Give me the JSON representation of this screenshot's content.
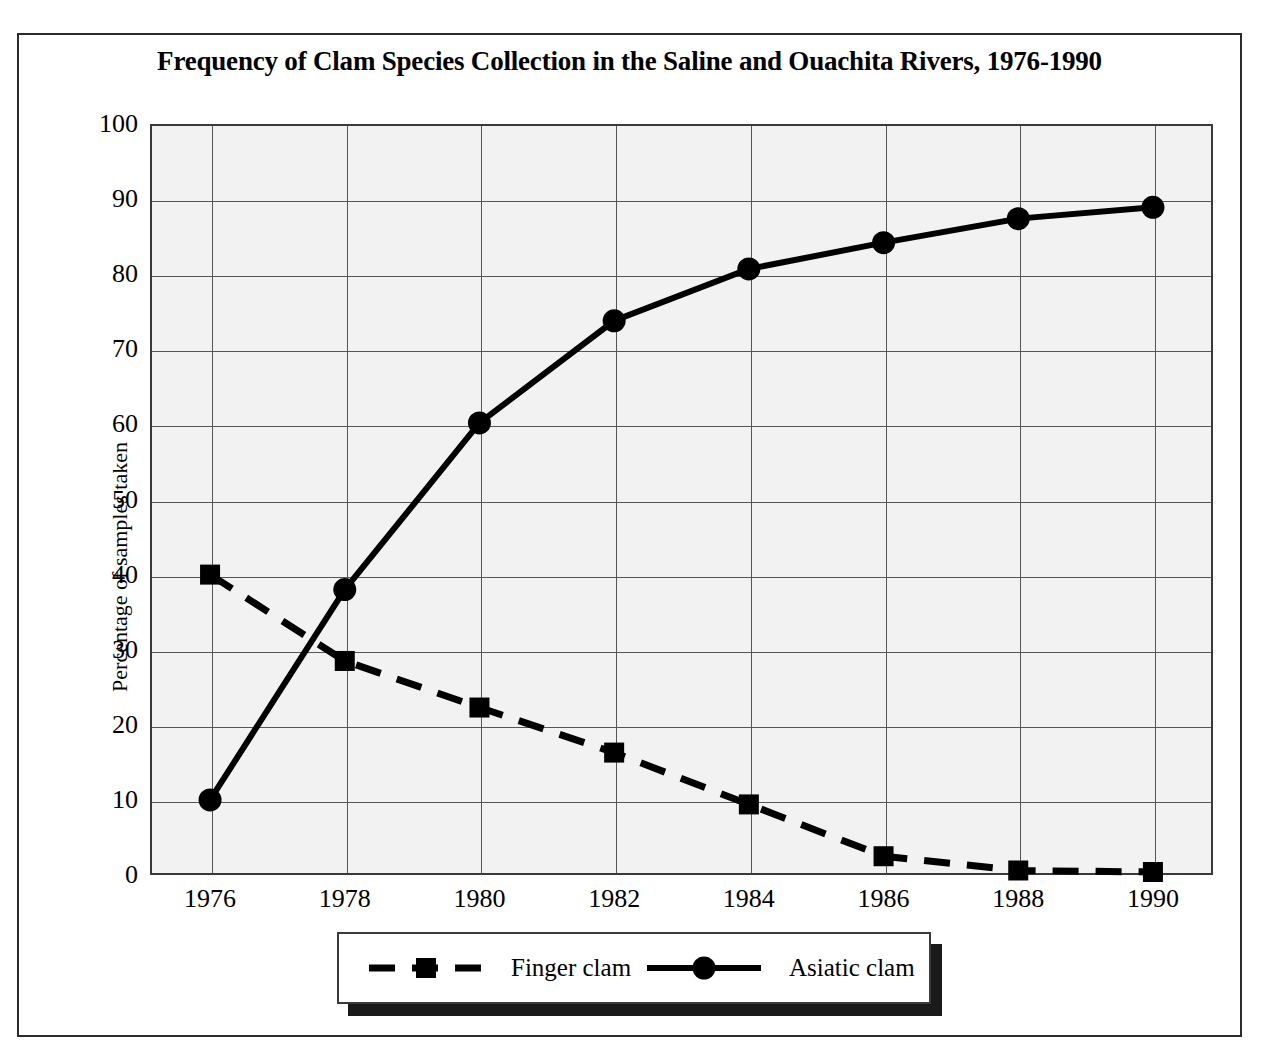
{
  "title": "Frequency of Clam Species Collection in the Saline and Ouachita Rivers, 1976-1990",
  "axes": {
    "ylabel": "Percentage of samples taken",
    "xlabel": "",
    "yticks": [
      "100",
      "90",
      "80",
      "70",
      "60",
      "50",
      "40",
      "30",
      "20",
      "10",
      "0"
    ],
    "xticks": [
      "1976",
      "1978",
      "1980",
      "1982",
      "1984",
      "1986",
      "1988",
      "1990"
    ]
  },
  "legend": {
    "items": [
      {
        "label": "Finger clam",
        "marker": "square",
        "line": "dashed"
      },
      {
        "label": "Asiatic clam",
        "marker": "circle",
        "line": "solid"
      }
    ]
  },
  "colors": {
    "series": "#000000",
    "plot_background": "#f2f2f2",
    "gridline": "#555555",
    "frame": "#3a3a3a",
    "legend_shadow": "#1a1a1a"
  },
  "chart_data": {
    "type": "line",
    "title": "Frequency of Clam Species Collection in the Saline and Ouachita Rivers, 1976-1990",
    "xlabel": "",
    "ylabel": "Percentage of samples taken",
    "x": [
      1976,
      1978,
      1980,
      1982,
      1984,
      1986,
      1988,
      1990
    ],
    "categories": [
      "1976",
      "1978",
      "1980",
      "1982",
      "1984",
      "1986",
      "1988",
      "1990"
    ],
    "xlim": [
      1975,
      1991
    ],
    "ylim": [
      0,
      100
    ],
    "yticks": [
      0,
      10,
      20,
      30,
      40,
      50,
      60,
      70,
      80,
      90,
      100
    ],
    "grid": true,
    "legend_position": "bottom",
    "series": [
      {
        "name": "Finger clam",
        "marker": "square",
        "linestyle": "dashed",
        "color": "#000000",
        "values": [
          40.0,
          28.5,
          22.3,
          16.3,
          9.4,
          2.5,
          0.6,
          0.4
        ]
      },
      {
        "name": "Asiatic clam",
        "marker": "circle",
        "linestyle": "solid",
        "color": "#000000",
        "values": [
          10.0,
          38.0,
          60.2,
          73.8,
          80.7,
          84.2,
          87.4,
          88.9
        ]
      }
    ]
  }
}
